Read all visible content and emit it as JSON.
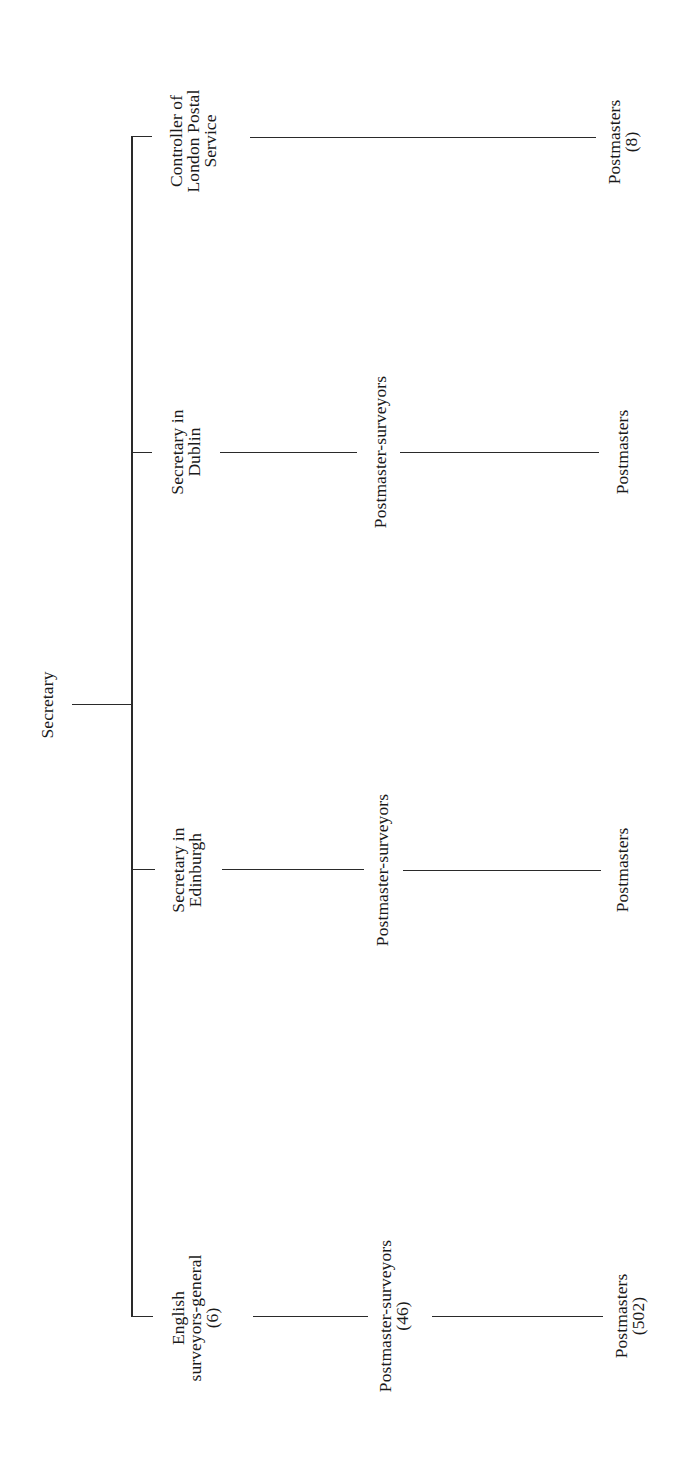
{
  "diagram": {
    "type": "org-chart",
    "orientation": "rotated-90-ccw",
    "root": {
      "label": "Secretary"
    },
    "branches": [
      {
        "id": "london",
        "head": {
          "lines": [
            "Controller of",
            "London Postal",
            "Service"
          ]
        },
        "levels": [
          {
            "lines": [
              "Postmasters",
              "(8)"
            ]
          }
        ]
      },
      {
        "id": "dublin",
        "head": {
          "lines": [
            "Secretary in",
            "Dublin"
          ]
        },
        "levels": [
          {
            "lines": [
              "Postmaster-surveyors"
            ]
          },
          {
            "lines": [
              "Postmasters"
            ]
          }
        ]
      },
      {
        "id": "edinburgh",
        "head": {
          "lines": [
            "Secretary in",
            "Edinburgh"
          ]
        },
        "levels": [
          {
            "lines": [
              "Postmaster-surveyors"
            ]
          },
          {
            "lines": [
              "Postmasters"
            ]
          }
        ]
      },
      {
        "id": "english",
        "head": {
          "lines": [
            "English",
            "surveyors-general",
            "(6)"
          ]
        },
        "levels": [
          {
            "lines": [
              "Postmaster-surveyors",
              "(46)"
            ]
          },
          {
            "lines": [
              "Postmasters",
              "(502)"
            ]
          }
        ]
      }
    ]
  },
  "colors": {
    "background": "#ffffff",
    "ink": "#1a1a1a",
    "lines": "#2a2a2a"
  }
}
